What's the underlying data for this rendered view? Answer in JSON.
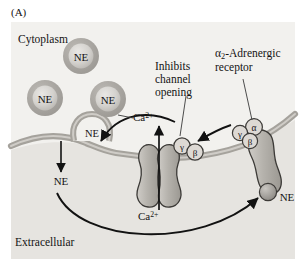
{
  "figure": {
    "panel_letter": "(A)",
    "compartments": {
      "cytoplasm": "Cytoplasm",
      "extracellular": "Extracellular"
    },
    "annotations": {
      "inhibits_channel_opening": "Inhibits\nchannel\nopening",
      "inhibits_line1": "Inhibits",
      "inhibits_line2": "channel",
      "inhibits_line3": "opening",
      "receptor_line1_prefix": "",
      "receptor_name": "-Adrenergic",
      "receptor_line2": "receptor",
      "receptor_greek": "α",
      "receptor_subscript": "2"
    },
    "ions": {
      "calcium_symbol": "Ca",
      "calcium_charge": "2+",
      "calcium_top": "Ca2+",
      "calcium_bottom": "Ca2+"
    },
    "neurotransmitter": {
      "abbrev": "NE",
      "vesicle_labels": [
        "NE",
        "NE",
        "NE"
      ],
      "fusing_vesicle_label": "NE",
      "released_label": "NE",
      "bound_ligand_label": "NE"
    },
    "g_protein": {
      "alpha": "α",
      "beta": "β",
      "gamma": "γ",
      "bound_complex_subunits": [
        "γ",
        "α",
        "β"
      ],
      "dissociated_subunits": [
        "γ",
        "β"
      ]
    },
    "colors": {
      "cytoplasm_fill": "#f2f1ee",
      "extracellular_fill": "#e6e4e0",
      "membrane": "#a5a29c",
      "membrane_edge": "#7d7a74",
      "protein_fill": "#b9b6b0",
      "protein_edge": "#3c3a37",
      "vesicle_ring": "#a8a5a0",
      "vesicle_core": "#d6d4d0",
      "arrow": "#121212",
      "text": "#141414"
    }
  }
}
